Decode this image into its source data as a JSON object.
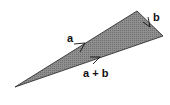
{
  "caption": "the direction of a and b on them each",
  "diagram": {
    "type": "vector-triangle",
    "fill_color": "#8a8a8a",
    "stroke_color": "#222222",
    "vertices": {
      "tail": [
        15,
        87
      ],
      "apex": [
        137,
        11
      ],
      "right": [
        163,
        36
      ]
    },
    "labels": {
      "a": "a",
      "b": "b",
      "sum": "a + b"
    }
  }
}
